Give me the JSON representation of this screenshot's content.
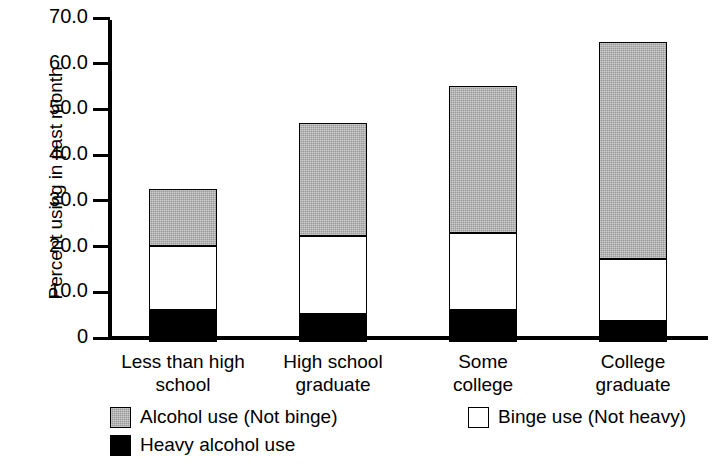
{
  "chart_data": {
    "type": "bar",
    "stacked": true,
    "title": "",
    "xlabel": "",
    "ylabel": "Percent using in past month",
    "ylim": [
      0,
      70
    ],
    "yticks": [
      "0",
      "10.0",
      "20.0",
      "30.0",
      "40.0",
      "50.0",
      "60.0",
      "70.0"
    ],
    "ytick_values": [
      0,
      10,
      20,
      30,
      40,
      50,
      60,
      70
    ],
    "grid": false,
    "legend_position": "bottom",
    "categories": [
      "Less than high school",
      "High school graduate",
      "Some college",
      "College graduate"
    ],
    "category_lines": [
      [
        "Less than high",
        "school"
      ],
      [
        "High school",
        "graduate"
      ],
      [
        "Some",
        "college"
      ],
      [
        "College",
        "graduate"
      ]
    ],
    "series": [
      {
        "name": "Heavy alcohol use",
        "color": "#000000",
        "values": [
          6.9,
          6.2,
          7.1,
          4.6
        ]
      },
      {
        "name": "Binge use (Not heavy)",
        "color": "#ffffff",
        "values": [
          14.1,
          17.0,
          16.8,
          13.6
        ]
      },
      {
        "name": "Alcohol use (Not binge)",
        "color": "#9a9a9a",
        "values": [
          12.4,
          24.8,
          32.2,
          47.5
        ]
      }
    ],
    "totals": [
      33.4,
      48.0,
      56.1,
      65.7
    ],
    "cumulative": {
      "heavy_top": [
        6.9,
        6.2,
        7.1,
        4.6
      ],
      "binge_top": [
        21.0,
        23.2,
        23.9,
        18.2
      ],
      "alcohol_top": [
        33.4,
        48.0,
        56.1,
        65.7
      ]
    }
  },
  "axis": {
    "y_title": "Percent using in past month"
  },
  "legend": {
    "items": [
      {
        "label": "Alcohol use (Not binge)",
        "swatch": "gray"
      },
      {
        "label": "Binge use (Not heavy)",
        "swatch": "white"
      },
      {
        "label": "Heavy alcohol use",
        "swatch": "black"
      }
    ]
  }
}
